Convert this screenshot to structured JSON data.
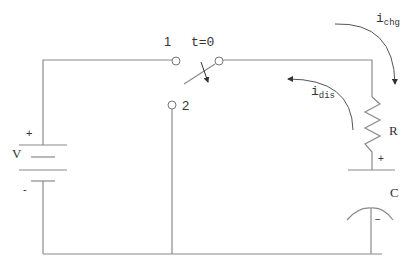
{
  "diagram": {
    "type": "circuit",
    "components": {
      "source": {
        "label": "V",
        "plus": "+",
        "minus": "-"
      },
      "switch": {
        "node1_label": "1",
        "node2_label": "2",
        "time_label": "t=0"
      },
      "resistor": {
        "label": "R"
      },
      "capacitor": {
        "label": "C",
        "plus": "+",
        "minus": "−"
      }
    },
    "currents": {
      "charge": {
        "symbol": "i",
        "subscript": "chg"
      },
      "discharge": {
        "symbol": "i",
        "subscript": "dis"
      }
    },
    "colors": {
      "wire": "#8a8a8a",
      "text": "#333333",
      "background": "#ffffff"
    }
  }
}
